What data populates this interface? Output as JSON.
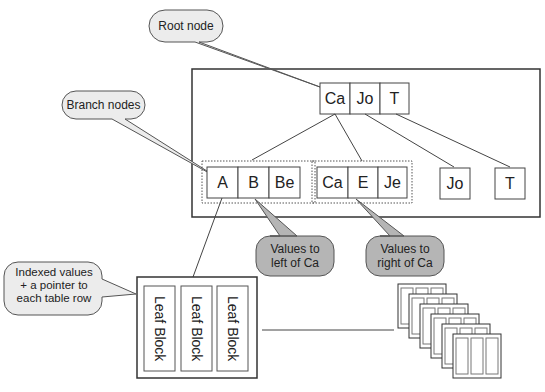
{
  "callouts": {
    "root": "Root node",
    "branch": "Branch nodes",
    "left": [
      "Values to",
      "left of Ca"
    ],
    "right": [
      "Values to",
      "right of Ca"
    ],
    "leaf": [
      "Indexed values",
      "+ a pointer to",
      "each table row"
    ]
  },
  "root_node": [
    "Ca",
    "Jo",
    "T"
  ],
  "branch_group_1": [
    "A",
    "B",
    "Be"
  ],
  "branch_group_2": [
    "Ca",
    "E",
    "Je"
  ],
  "single_nodes": [
    "Jo",
    "T"
  ],
  "leaf_blocks": [
    "Leaf Block",
    "Leaf Block",
    "Leaf Block"
  ],
  "colors": {
    "callout_light": "#ececec",
    "callout_dark": "#b5b5b5",
    "stroke": "#333333"
  }
}
